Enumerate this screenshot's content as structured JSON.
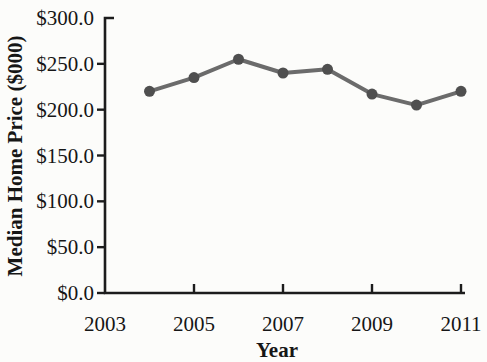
{
  "figure": {
    "background": "#fcfcfa"
  },
  "chart_data": {
    "type": "line",
    "title": "",
    "xlabel": "Year",
    "ylabel": "Median Home Price ($000)",
    "series": [
      {
        "name": "Median Home Price",
        "x": [
          2004,
          2005,
          2006,
          2007,
          2008,
          2009,
          2010,
          2011
        ],
        "values": [
          220,
          235,
          255,
          240,
          244,
          217,
          205,
          220
        ]
      }
    ],
    "xlim": [
      2003,
      2011
    ],
    "ylim": [
      0,
      300
    ],
    "x_ticks": [
      2003,
      2005,
      2007,
      2009,
      2011
    ],
    "x_tick_labels": [
      "2003",
      "2005",
      "2007",
      "2009",
      "2011"
    ],
    "y_ticks": [
      0,
      50,
      100,
      150,
      200,
      250,
      300
    ],
    "y_tick_labels": [
      "$0.0",
      "$50.0",
      "$100.0",
      "$150.0",
      "$200.0",
      "$250.0",
      "$300.0"
    ],
    "grid": false,
    "legend_position": "none",
    "marker": "circle",
    "line_color": "#6b6b6b",
    "marker_color": "#4f4f4f",
    "axis_color": "#1c1c1c",
    "text_color": "#161616"
  }
}
